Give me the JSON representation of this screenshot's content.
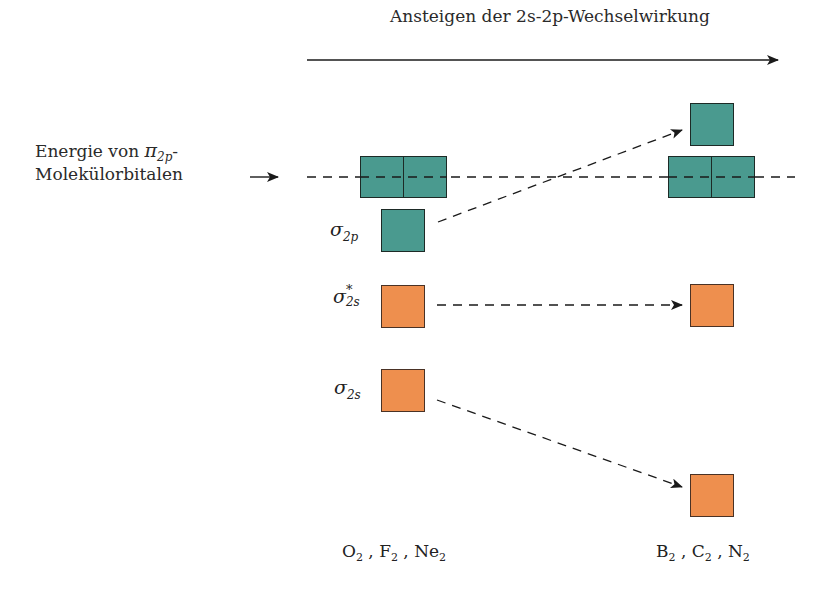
{
  "header": {
    "arrow_label_pre": "Ansteigen der ",
    "arrow_label_2s": "2s",
    "arrow_label_mid": "-",
    "arrow_label_2p": "2p",
    "arrow_label_post": "-Wechselwirkung"
  },
  "energy_label": {
    "line1_text": "Energie von ",
    "line1_symbol": "π",
    "line1_sub": "2p",
    "line1_suffix": "-",
    "line2": "Molekülorbitalen"
  },
  "orbitals": {
    "sigma_2p": {
      "symbol": "σ",
      "sub": "2p"
    },
    "sigma_star_2s": {
      "symbol": "σ",
      "sup": "*",
      "sub": "2s"
    },
    "sigma_2s": {
      "symbol": "σ",
      "sub": "2s"
    }
  },
  "groups": {
    "left": [
      {
        "el": "O",
        "n": "2"
      },
      {
        "el": "F",
        "n": "2"
      },
      {
        "el": "Ne",
        "n": "2"
      }
    ],
    "right": [
      {
        "el": "B",
        "n": "2"
      },
      {
        "el": "C",
        "n": "2"
      },
      {
        "el": "N",
        "n": "2"
      }
    ],
    "separator": " , "
  },
  "colors": {
    "pi_orbital": "#4a9a8f",
    "sigma_s_orbital": "#ee8f4e"
  }
}
